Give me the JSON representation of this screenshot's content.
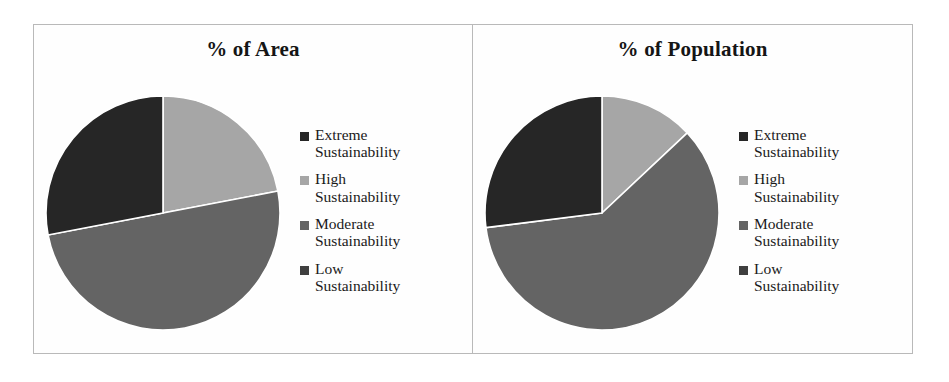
{
  "figure": {
    "background_color": "#ffffff",
    "border_color": "#b9b9b9"
  },
  "palette": {
    "extreme": "#262626",
    "high": "#a6a6a6",
    "moderate": "#646464",
    "low": "#3f3f3f"
  },
  "legend": {
    "items": [
      {
        "label": "Extreme\nSustainability",
        "swatch_name": "legend-swatch-extreme",
        "color": "#262626"
      },
      {
        "label": "High\nSustainability",
        "swatch_name": "legend-swatch-high",
        "color": "#a6a6a6"
      },
      {
        "label": "Moderate\nSustainability",
        "swatch_name": "legend-swatch-moderate",
        "color": "#646464"
      },
      {
        "label": "Low\nSustainability",
        "swatch_name": "legend-swatch-low",
        "color": "#3f3f3f"
      }
    ]
  },
  "chart_data": [
    {
      "type": "pie",
      "title": "% of Area",
      "categories": [
        "Extreme Sustainability",
        "High Sustainability",
        "Moderate Sustainability",
        "Low Sustainability"
      ],
      "values": [
        28,
        22,
        50,
        0
      ],
      "colors": [
        "#262626",
        "#a6a6a6",
        "#646464",
        "#3f3f3f"
      ],
      "start_angle": 90,
      "direction": "clockwise",
      "legend_position": "right",
      "grid": false
    },
    {
      "type": "pie",
      "title": "% of Population",
      "categories": [
        "Extreme Sustainability",
        "High Sustainability",
        "Moderate Sustainability",
        "Low Sustainability"
      ],
      "values": [
        27,
        13,
        60,
        0
      ],
      "colors": [
        "#262626",
        "#a6a6a6",
        "#646464",
        "#3f3f3f"
      ],
      "start_angle": 90,
      "direction": "clockwise",
      "legend_position": "right",
      "grid": false
    }
  ]
}
